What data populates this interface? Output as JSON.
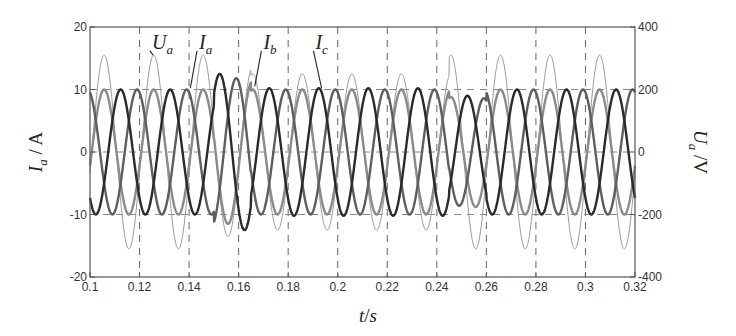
{
  "chart_data": {
    "type": "line",
    "title": "",
    "xlabel": "t/s",
    "ylabel_left": "I_a / A",
    "ylabel_right": "U_a /V",
    "x_range": [
      0.1,
      0.32
    ],
    "ylim_left": [
      -20,
      20
    ],
    "ylim_right": [
      -400,
      400
    ],
    "x_ticks": [
      0.1,
      0.12,
      0.14,
      0.16,
      0.18,
      0.2,
      0.22,
      0.24,
      0.26,
      0.28,
      0.3,
      0.32
    ],
    "x_tick_labels": [
      "0.1",
      "0.12",
      "0.14",
      "0.16",
      "0.18",
      "0.2",
      "0.22",
      "0.24",
      "0.26",
      "0.28",
      "0.3",
      "0.32"
    ],
    "y_ticks_left": [
      -20,
      -10,
      0,
      10,
      20
    ],
    "y_tick_labels_left": [
      "-20",
      "-10",
      "0",
      "10",
      "20"
    ],
    "y_ticks_right": [
      -400,
      -200,
      0,
      200,
      400
    ],
    "y_tick_labels_right": [
      "-400",
      "-200",
      "0",
      "200",
      "400"
    ],
    "grid": {
      "vertical_dashed_at": [
        0.12,
        0.14,
        0.16,
        0.18,
        0.2,
        0.22,
        0.24,
        0.26,
        0.28,
        0.3
      ],
      "horizontal_dashed_at_left": [
        -10,
        0,
        10
      ]
    },
    "frequency_hz": 50,
    "series": [
      {
        "name": "Ua",
        "label": "U",
        "sub": "a",
        "axis": "right",
        "color": "#9a9a9a",
        "width": 1.0,
        "phase_deg": 0,
        "amplitude_segments": [
          {
            "t0": 0.1,
            "t1": 0.15,
            "amp": 310
          },
          {
            "t0": 0.15,
            "t1": 0.165,
            "amp": 270
          },
          {
            "t0": 0.165,
            "t1": 0.245,
            "amp": 250
          },
          {
            "t0": 0.245,
            "t1": 0.32,
            "amp": 310
          }
        ]
      },
      {
        "name": "Ia",
        "label": "I",
        "sub": "a",
        "axis": "left",
        "color": "#8a8a8a",
        "width": 2.4,
        "phase_deg": 0,
        "amplitude_segments": [
          {
            "t0": 0.1,
            "t1": 0.15,
            "amp": 10
          },
          {
            "t0": 0.15,
            "t1": 0.165,
            "amp": 11.5
          },
          {
            "t0": 0.165,
            "t1": 0.245,
            "amp": 10
          },
          {
            "t0": 0.245,
            "t1": 0.26,
            "amp": 8.8
          },
          {
            "t0": 0.26,
            "t1": 0.32,
            "amp": 10
          }
        ]
      },
      {
        "name": "Ib",
        "label": "I",
        "sub": "b",
        "axis": "left",
        "color": "#2a2a2a",
        "width": 2.4,
        "phase_deg": -120,
        "amplitude_segments": [
          {
            "t0": 0.1,
            "t1": 0.15,
            "amp": 10
          },
          {
            "t0": 0.15,
            "t1": 0.165,
            "amp": 12.5
          },
          {
            "t0": 0.165,
            "t1": 0.245,
            "amp": 10.2
          },
          {
            "t0": 0.245,
            "t1": 0.26,
            "amp": 9
          },
          {
            "t0": 0.26,
            "t1": 0.32,
            "amp": 10
          }
        ]
      },
      {
        "name": "Ic",
        "label": "I",
        "sub": "c",
        "axis": "left",
        "color": "#5e5e5e",
        "width": 2.4,
        "phase_deg": 120,
        "amplitude_segments": [
          {
            "t0": 0.1,
            "t1": 0.15,
            "amp": 10
          },
          {
            "t0": 0.15,
            "t1": 0.165,
            "amp": 11.8
          },
          {
            "t0": 0.165,
            "t1": 0.245,
            "amp": 10
          },
          {
            "t0": 0.245,
            "t1": 0.26,
            "amp": 8.6
          },
          {
            "t0": 0.26,
            "t1": 0.32,
            "amp": 10
          }
        ]
      }
    ],
    "annotations": [
      {
        "text": "U",
        "sub": "a",
        "target": "Ua",
        "label_x": 0.125,
        "label_y_left": 16.5,
        "arrow_to": [
          0.1255,
          15.5
        ]
      },
      {
        "text": "I",
        "sub": "a",
        "target": "Ia",
        "label_x": 0.144,
        "label_y_left": 16.5,
        "arrow_to": [
          0.1405,
          10.2
        ]
      },
      {
        "text": "I",
        "sub": "b",
        "target": "Ib",
        "label_x": 0.17,
        "label_y_left": 16.5,
        "arrow_to": [
          0.1665,
          10.5
        ]
      },
      {
        "text": "I",
        "sub": "c",
        "target": "Ic",
        "label_x": 0.191,
        "label_y_left": 16.5,
        "arrow_to": [
          0.1935,
          10.2
        ]
      }
    ]
  },
  "plot_frame": {
    "left": 90,
    "right": 635,
    "top": 27,
    "bottom": 277
  },
  "labels": {
    "xlabel_t": "t",
    "xlabel_sep": "/",
    "xlabel_s": "s",
    "ylabel_left_I": "I",
    "ylabel_left_sub": "a",
    "ylabel_left_unit": " / A",
    "ylabel_right_U": "U",
    "ylabel_right_sub": "a",
    "ylabel_right_unit": " /V"
  }
}
